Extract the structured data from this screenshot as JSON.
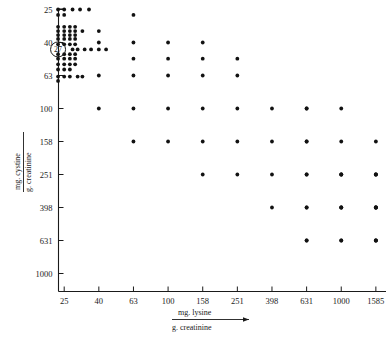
{
  "chart_data": {
    "type": "scatter",
    "title": "",
    "xlabel": "mg. lysine / g. creatinine",
    "ylabel": "mg. cystine / g. creatinine",
    "xlabel_numerator": "mg. lysine",
    "xlabel_denominator": "g. creatinine",
    "ylabel_numerator": "mg. cystine",
    "ylabel_denominator": "g. creatinine",
    "xscale": "log",
    "yscale": "log",
    "grid": false,
    "legend": null,
    "xticks": [
      25,
      40,
      63,
      100,
      158,
      251,
      398,
      631,
      1000,
      1585
    ],
    "xtick_labels": [
      "25",
      "40",
      "63",
      "100",
      "158",
      "251",
      "398",
      "631",
      "1000",
      "1585"
    ],
    "yticks": [
      25,
      40,
      63,
      100,
      158,
      251,
      398,
      631,
      1000
    ],
    "ytick_labels": [
      "25",
      "40",
      "63",
      "100",
      "158",
      "251",
      "398",
      "631",
      "1000"
    ],
    "xlim": [
      20,
      2000
    ],
    "ylim": [
      21,
      1000
    ],
    "annotations": [
      {
        "label": "27",
        "shape": "circled-number",
        "x": 23,
        "y": 44
      }
    ],
    "points": [
      [
        23,
        68
      ],
      [
        23,
        64
      ],
      [
        25,
        64
      ],
      [
        27,
        64
      ],
      [
        30,
        64
      ],
      [
        32,
        64
      ],
      [
        23,
        58
      ],
      [
        25,
        58
      ],
      [
        27,
        58
      ],
      [
        23,
        54
      ],
      [
        25,
        54
      ],
      [
        27,
        54
      ],
      [
        29,
        54
      ],
      [
        23,
        50
      ],
      [
        25,
        50
      ],
      [
        27,
        50
      ],
      [
        29,
        50
      ],
      [
        23,
        47
      ],
      [
        25,
        47
      ],
      [
        27,
        47
      ],
      [
        29,
        47
      ],
      [
        28,
        44
      ],
      [
        30,
        44
      ],
      [
        33,
        44
      ],
      [
        36,
        44
      ],
      [
        40,
        44
      ],
      [
        44,
        44
      ],
      [
        23,
        41
      ],
      [
        25,
        41
      ],
      [
        27,
        41
      ],
      [
        29,
        41
      ],
      [
        23,
        38
      ],
      [
        25,
        38
      ],
      [
        27,
        38
      ],
      [
        29,
        38
      ],
      [
        23,
        36
      ],
      [
        25,
        36
      ],
      [
        27,
        36
      ],
      [
        29,
        36
      ],
      [
        23,
        34
      ],
      [
        25,
        34
      ],
      [
        27,
        34
      ],
      [
        29,
        34
      ],
      [
        32,
        34
      ],
      [
        23,
        32
      ],
      [
        25,
        32
      ],
      [
        27,
        32
      ],
      [
        29,
        32
      ],
      [
        23,
        27
      ],
      [
        25,
        27
      ],
      [
        23,
        25
      ],
      [
        25,
        25
      ],
      [
        28,
        25
      ],
      [
        31,
        25
      ],
      [
        35,
        25
      ],
      [
        40,
        100
      ],
      [
        40,
        63
      ],
      [
        40,
        40
      ],
      [
        40,
        34
      ],
      [
        63,
        158
      ],
      [
        63,
        100
      ],
      [
        63,
        63
      ],
      [
        63,
        50
      ],
      [
        63,
        40
      ],
      [
        63,
        27
      ],
      [
        100,
        158
      ],
      [
        100,
        100
      ],
      [
        100,
        63
      ],
      [
        100,
        50
      ],
      [
        100,
        40
      ],
      [
        158,
        251
      ],
      [
        158,
        158
      ],
      [
        158,
        100
      ],
      [
        158,
        63
      ],
      [
        158,
        50
      ],
      [
        158,
        40
      ],
      [
        251,
        251
      ],
      [
        251,
        158
      ],
      [
        251,
        100
      ],
      [
        251,
        63
      ],
      [
        251,
        50
      ],
      [
        398,
        398
      ],
      [
        398,
        251
      ],
      [
        398,
        158
      ],
      [
        398,
        100
      ],
      [
        631,
        631
      ],
      [
        631,
        631
      ],
      [
        631,
        398
      ],
      [
        631,
        398
      ],
      [
        631,
        251
      ],
      [
        631,
        251
      ],
      [
        631,
        158
      ],
      [
        631,
        158
      ],
      [
        631,
        100
      ],
      [
        631,
        100
      ],
      [
        1000,
        631
      ],
      [
        1000,
        631
      ],
      [
        1000,
        398
      ],
      [
        1000,
        398
      ],
      [
        1000,
        398
      ],
      [
        1000,
        251
      ],
      [
        1000,
        251
      ],
      [
        1000,
        251
      ],
      [
        1000,
        158
      ],
      [
        1000,
        100
      ],
      [
        1585,
        631
      ],
      [
        1585,
        631
      ],
      [
        1585,
        631
      ],
      [
        1585,
        398
      ],
      [
        1585,
        398
      ],
      [
        1585,
        398
      ],
      [
        1585,
        398
      ],
      [
        1585,
        251
      ],
      [
        1585,
        251
      ],
      [
        1585,
        251
      ],
      [
        1585,
        158
      ]
    ]
  }
}
